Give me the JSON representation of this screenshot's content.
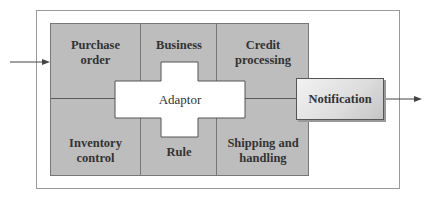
{
  "diagram": {
    "input_arrow": "incoming",
    "output_arrow": "outgoing",
    "blocks": [
      {
        "id": "purchase-order",
        "label_line1": "Purchase",
        "label_line2": "order"
      },
      {
        "id": "business",
        "label_line1": "Business",
        "label_line2": ""
      },
      {
        "id": "credit-processing",
        "label_line1": "Credit",
        "label_line2": "processing"
      },
      {
        "id": "inventory-control",
        "label_line1": "Inventory",
        "label_line2": "control"
      },
      {
        "id": "rule",
        "label_line1": "Rule",
        "label_line2": ""
      },
      {
        "id": "shipping-handling",
        "label_line1": "Shipping and",
        "label_line2": "handling"
      }
    ],
    "adaptor": {
      "label": "Adaptor"
    },
    "notification": {
      "label": "Notification"
    },
    "colors": {
      "block_fill": "#bdbdbd",
      "line": "#5a5a5a",
      "adaptor_fill": "#ffffff"
    }
  }
}
